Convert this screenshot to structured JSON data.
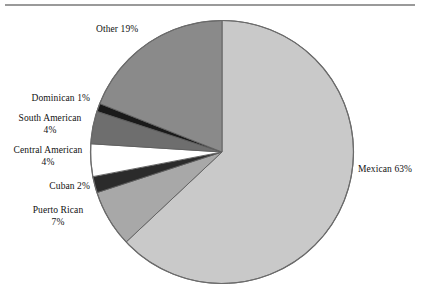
{
  "figure": {
    "has_top_rule": true,
    "background_color": "#ffffff"
  },
  "chart_data": {
    "type": "pie",
    "title": "",
    "xlabel": "",
    "ylabel": "",
    "legend_position": "none",
    "labels_placement": "outside",
    "start_angle_deg": 0,
    "direction": "clockwise",
    "categories": [
      "Mexican",
      "Puerto Rican",
      "Cuban",
      "Central American",
      "South American",
      "Dominican",
      "Other"
    ],
    "values": [
      63,
      7,
      2,
      4,
      4,
      1,
      19
    ],
    "value_unit": "percent",
    "colors": [
      "#c9c9c9",
      "#a8a8a8",
      "#2b2b2b",
      "#ffffff",
      "#6e6e6e",
      "#1a1a1a",
      "#8a8a8a"
    ],
    "slices": [
      {
        "name": "Mexican",
        "value": 63,
        "label": "Mexican 63%",
        "label_text": "Mexican",
        "label_pct": "63%",
        "color": "#c9c9c9"
      },
      {
        "name": "Puerto Rican",
        "value": 7,
        "label": "Puerto Rican 7%",
        "label_text": "Puerto Rican",
        "label_pct": "7%",
        "color": "#a8a8a8"
      },
      {
        "name": "Cuban",
        "value": 2,
        "label": "Cuban 2%",
        "label_text": "Cuban",
        "label_pct": "2%",
        "color": "#2b2b2b"
      },
      {
        "name": "Central American",
        "value": 4,
        "label": "Central American 4%",
        "label_text": "Central American",
        "label_pct": "4%",
        "color": "#ffffff"
      },
      {
        "name": "South American",
        "value": 4,
        "label": "South American 4%",
        "label_text": "South American",
        "label_pct": "4%",
        "color": "#6e6e6e"
      },
      {
        "name": "Dominican",
        "value": 1,
        "label": "Dominican 1%",
        "label_text": "Dominican",
        "label_pct": "1%",
        "color": "#1a1a1a"
      },
      {
        "name": "Other",
        "value": 19,
        "label": "Other 19%",
        "label_text": "Other",
        "label_pct": "19%",
        "color": "#8a8a8a"
      }
    ]
  },
  "labels": {
    "mexican": "Mexican 63%",
    "other": "Other 19%",
    "dominican": "Dominican 1%",
    "south_american_name": "South  American",
    "south_american_pct": "4%",
    "central_american_name": "Central American",
    "central_american_pct": "4%",
    "cuban": "Cuban 2%",
    "puerto_rican_name": "Puerto Rican",
    "puerto_rican_pct": "7%"
  }
}
